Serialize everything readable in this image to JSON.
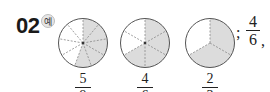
{
  "problem": {
    "number": "02",
    "example_badge": "예",
    "answer": {
      "prefix": ";",
      "numerator": "4",
      "denominator": "6",
      "suffix": ","
    }
  },
  "circles": [
    {
      "divisions": 9,
      "shaded": 5,
      "fraction": {
        "numerator": "5",
        "denominator": "9"
      }
    },
    {
      "divisions": 6,
      "shaded": 4,
      "fraction": {
        "numerator": "4",
        "denominator": "6"
      }
    },
    {
      "divisions": 3,
      "shaded": 2,
      "fraction": {
        "numerator": "2",
        "denominator": "3"
      }
    }
  ],
  "colors": {
    "shade": "#dcdcdc",
    "outline": "#555555",
    "divider": "#888888"
  }
}
